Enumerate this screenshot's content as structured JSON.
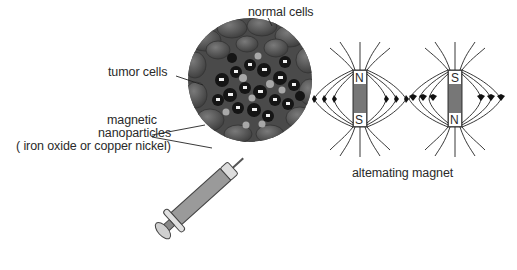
{
  "diagram": {
    "labels": {
      "normal_cells": "normal cells",
      "tumor_cells": "tumor cells",
      "nanoparticles_line1": "magnetic",
      "nanoparticles_line2": "nanoparticles",
      "nanoparticles_line3": "( iron oxide or copper nickel)",
      "magnet_caption": "altemating magnet"
    },
    "magnets": [
      {
        "top_pole": "N",
        "bottom_pole": "S"
      },
      {
        "top_pole": "S",
        "bottom_pole": "N"
      }
    ],
    "colors": {
      "text": "#2a2a2a",
      "line": "#222222",
      "magnet_fill": "#777777",
      "cell_dark": "#3a3a3a",
      "cell_mid": "#5e5e5e",
      "syringe_body": "#9a9a9a"
    }
  }
}
